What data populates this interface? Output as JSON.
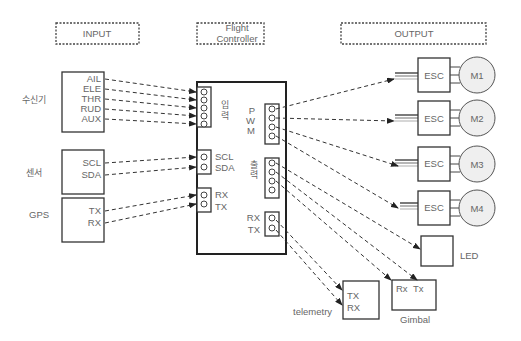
{
  "headers": {
    "input": "INPUT",
    "flight_controller_line1": "Flight",
    "flight_controller_line2": "Controller",
    "output": "OUTPUT"
  },
  "inputs": {
    "receiver": {
      "label": "수신기",
      "channels": [
        "AIL",
        "ELE",
        "THR",
        "RUD",
        "AUX"
      ]
    },
    "sensor": {
      "label": "센서",
      "channels": [
        "SCL",
        "SDA"
      ]
    },
    "gps": {
      "label": "GPS",
      "channels": [
        "TX",
        "RX"
      ]
    }
  },
  "flight_controller": {
    "input_port_label_1": "입",
    "input_port_label_2": "력",
    "i2c_labels": [
      "SCL",
      "SDA"
    ],
    "gps_labels": [
      "RX",
      "TX"
    ],
    "pwm_labels": [
      "P",
      "W",
      "M"
    ],
    "output_port_label_1": "출",
    "output_port_label_2": "력",
    "telemetry_labels": [
      "RX",
      "TX"
    ]
  },
  "outputs": {
    "escs": [
      {
        "esc_label": "ESC",
        "motor_label": "M1"
      },
      {
        "esc_label": "ESC",
        "motor_label": "M2"
      },
      {
        "esc_label": "ESC",
        "motor_label": "M3"
      },
      {
        "esc_label": "ESC",
        "motor_label": "M4"
      }
    ],
    "led_label": "LED",
    "gimbal": {
      "label": "Gimbal",
      "pins": [
        "Rx",
        "Tx"
      ]
    },
    "telemetry": {
      "label": "telemetry",
      "pins": [
        "TX",
        "RX"
      ]
    }
  },
  "colors": {
    "line": "#333333",
    "text": "#666666",
    "motor_fill": "#efefef"
  }
}
